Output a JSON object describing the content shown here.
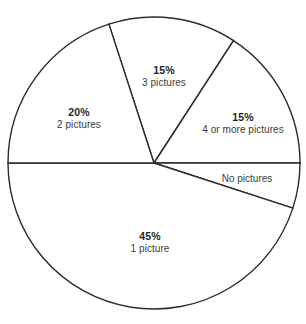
{
  "chart_data": {
    "type": "pie",
    "title": "",
    "xlabel": "",
    "ylabel": "",
    "legend_position": "none",
    "grid": false,
    "labels_inside": true,
    "total_percent": 100,
    "categories": [
      "3 pictures",
      "4 or more pictures",
      "No pictures",
      "1 picture",
      "2 pictures"
    ],
    "values": [
      15,
      15,
      5,
      45,
      20
    ],
    "slices": [
      {
        "name": "3 pictures",
        "percent_label": "15%",
        "category_label": "3 pictures",
        "value": 15,
        "start_angle_deg": 108,
        "end_angle_deg": 57,
        "label_x": 164,
        "label_y": 77,
        "fill": "#ffffff",
        "stroke": "#2b2b2b"
      },
      {
        "name": "4 or more pictures",
        "percent_label": "15%",
        "category_label": "4 or more pictures",
        "value": 15,
        "start_angle_deg": 57,
        "end_angle_deg": 0,
        "label_x": 243,
        "label_y": 124,
        "fill": "#ffffff",
        "stroke": "#2b2b2b"
      },
      {
        "name": "No pictures",
        "percent_label": "",
        "category_label": "No pictures",
        "value": 5,
        "start_angle_deg": 0,
        "end_angle_deg": -18,
        "label_x": 247,
        "label_y": 179,
        "fill": "#ffffff",
        "stroke": "#2b2b2b"
      },
      {
        "name": "1 picture",
        "percent_label": "45%",
        "category_label": "1 picture",
        "value": 45,
        "start_angle_deg": -18,
        "end_angle_deg": -180,
        "label_x": 150,
        "label_y": 243,
        "fill": "#ffffff",
        "stroke": "#2b2b2b"
      },
      {
        "name": "2 pictures",
        "percent_label": "20%",
        "category_label": "2 pictures",
        "value": 20,
        "start_angle_deg": 180,
        "end_angle_deg": 108,
        "label_x": 79,
        "label_y": 119,
        "fill": "#ffffff",
        "stroke": "#2b2b2b"
      }
    ],
    "geometry": {
      "center_x": 154,
      "center_y": 163,
      "radius": 146
    }
  }
}
